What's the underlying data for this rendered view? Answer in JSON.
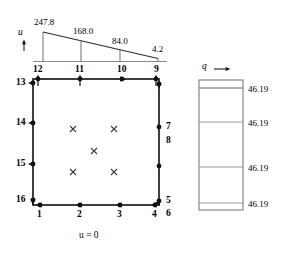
{
  "figure": {
    "type": "finite-element-mesh-diagram"
  },
  "head_profile": {
    "axis_label": "u",
    "axis_arrow": "up-arrow",
    "values": [
      "247.8",
      "168.0",
      "84.0",
      "4.2"
    ],
    "boundary_condition": "u = 0"
  },
  "flux_panel": {
    "label": "q",
    "arrow": "right-arrow",
    "values": [
      "46.19",
      "46.19",
      "46.19",
      "46.19"
    ]
  },
  "nodes": {
    "top": [
      "12",
      "11",
      "10",
      "9"
    ],
    "left": [
      "13",
      "14",
      "15",
      "16"
    ],
    "right": [
      "7",
      "8",
      "5"
    ],
    "right_corner_top": "9",
    "bottom": [
      "1",
      "2",
      "3",
      "4"
    ],
    "bottom_right": [
      "5",
      "6"
    ]
  },
  "interior_markers": {
    "symbol": "x",
    "count": 5
  },
  "colors": {
    "line": "#1a1a1a",
    "thin_line": "#6e6e6e",
    "background": "#ffffff"
  }
}
